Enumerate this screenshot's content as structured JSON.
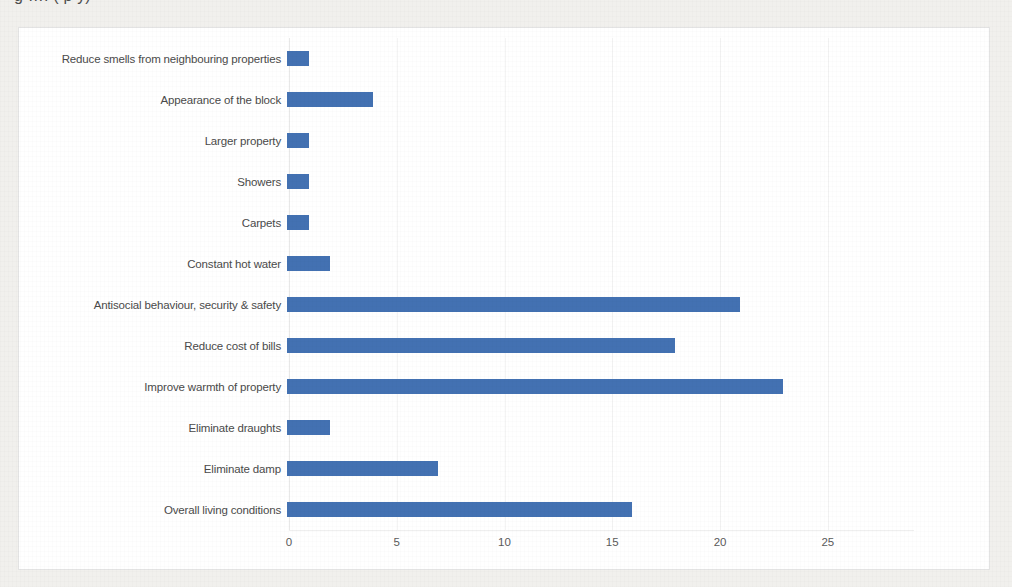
{
  "document": {
    "title_fragment": "g      ….   (  p      y)"
  },
  "chart_data": {
    "type": "bar",
    "orientation": "horizontal",
    "title": "",
    "xlabel": "",
    "ylabel": "",
    "xlim": [
      0,
      29
    ],
    "xticks": [
      0,
      5,
      10,
      15,
      20,
      25
    ],
    "grid": true,
    "legend": false,
    "bar_color": "#4371b2",
    "categories": [
      "Reduce smells from neighbouring properties",
      "Appearance of the block",
      "Larger property",
      "Showers",
      "Carpets",
      "Constant hot water",
      "Antisocial behaviour, security & safety",
      "Reduce cost of bills",
      "Improve warmth of property",
      "Eliminate draughts",
      "Eliminate damp",
      "Overall living conditions"
    ],
    "values": [
      1,
      4,
      1,
      1,
      1,
      2,
      21,
      18,
      23,
      2,
      7,
      16
    ]
  }
}
